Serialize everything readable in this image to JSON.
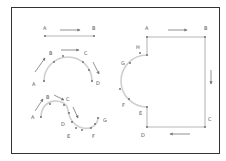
{
  "figure": {
    "frame_color": "#333333",
    "path_color": "#cfcfcf",
    "point_color": "#666666",
    "arrow_color": "#777777",
    "background": "#ffffff"
  },
  "straight_line": {
    "labels": [
      "A",
      "B"
    ],
    "direction": "left-to-right"
  },
  "semicircle_arc": {
    "labels": [
      "A",
      "B",
      "C",
      "D"
    ],
    "direction": "clockwise A to D"
  },
  "s_curve": {
    "labels": [
      "A",
      "B",
      "C",
      "D",
      "E",
      "F",
      "G"
    ],
    "direction": "A to G"
  },
  "closed_path": {
    "labels": [
      "A",
      "B",
      "C",
      "D",
      "E",
      "F",
      "G",
      "H"
    ],
    "direction": "clockwise A-B-C-D-E-F-G-H"
  }
}
